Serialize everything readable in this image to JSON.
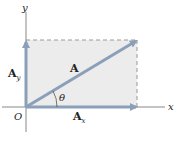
{
  "diagram": {
    "axes": {
      "x_label": "x",
      "y_label": "y",
      "origin_label": "O"
    },
    "vector": {
      "label": "A",
      "angle_label": "θ"
    },
    "components": {
      "x": {
        "label": "A",
        "subscript": "x"
      },
      "y": {
        "label": "A",
        "subscript": "y"
      }
    },
    "colors": {
      "axis": "#888888",
      "vector": "#8aa0b8",
      "fill": "#ececec",
      "dashed": "#999999",
      "text": "#222222"
    }
  }
}
